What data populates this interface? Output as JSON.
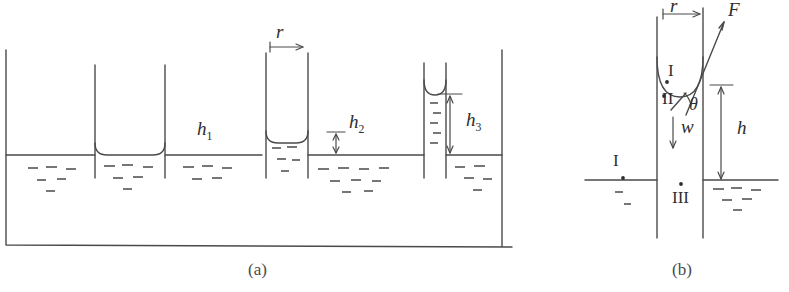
{
  "figure": {
    "title_a": "(a)",
    "title_b": "(b)",
    "panel_a": {
      "labels": {
        "radius": "r",
        "h1": "h",
        "h1_sub": "1",
        "h2": "h",
        "h2_sub": "2",
        "h3": "h",
        "h3_sub": "3"
      },
      "description": "Open vessel of liquid with four vertical capillary tubes of decreasing radius; meniscus rise height increases as tube radius decreases",
      "tubes": [
        {
          "name": "tube-wide-flat",
          "radius_px": 35,
          "rise_px": 0,
          "meniscus": "flat"
        },
        {
          "name": "tube-medium",
          "radius_px": 21,
          "rise_px": 12,
          "meniscus": "concave"
        },
        {
          "name": "tube-narrow",
          "radius_px": 10,
          "rise_px": 60,
          "meniscus": "concave"
        }
      ]
    },
    "panel_b": {
      "labels": {
        "radius": "r",
        "force": "F",
        "angle": "θ",
        "weight": "w",
        "height": "h",
        "point_I_outer": "I",
        "point_I_inner": "I",
        "point_II": "II",
        "point_III": "III"
      },
      "description": "Close-up of a single capillary tube showing the contact angle theta, the surface-tension force F acting along the meniscus, the weight w of the raised liquid column, and the capillary rise h measured from the bulk liquid surface"
    }
  },
  "style": {
    "line_color": "#4a4a4a",
    "text_color": "#2e2e2e",
    "background": "#ffffff"
  }
}
